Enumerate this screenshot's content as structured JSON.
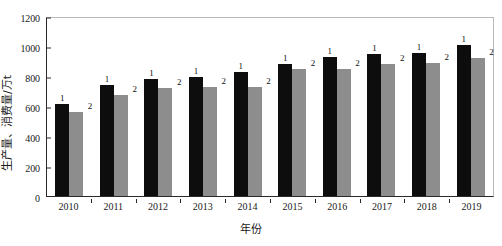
{
  "chart_data": {
    "type": "bar",
    "title": "",
    "xlabel": "年份",
    "ylabel": "生产量、消费量/万t",
    "categories": [
      "2010",
      "2011",
      "2012",
      "2013",
      "2014",
      "2015",
      "2016",
      "2017",
      "2018",
      "2019"
    ],
    "ylim": [
      0,
      1200
    ],
    "yticks": [
      0,
      200,
      400,
      600,
      800,
      1000,
      1200
    ],
    "grid": false,
    "legend_position": "none",
    "series": [
      {
        "name": "1",
        "label": "1",
        "color": "#0d0d0d",
        "values": [
          611,
          737,
          780,
          795,
          825,
          880,
          925,
          945,
          955,
          1005
        ]
      },
      {
        "name": "2",
        "label": "2",
        "color": "#8d8d8d",
        "values": [
          563,
          672,
          720,
          730,
          730,
          850,
          845,
          880,
          890,
          920
        ]
      }
    ],
    "point_labels": {
      "series_1": [
        "1",
        "1",
        "1",
        "1",
        "1",
        "1",
        "1",
        "1",
        "1",
        "1"
      ],
      "series_2": [
        "2",
        "2",
        "2",
        "2",
        "2",
        "2",
        "2",
        "2",
        "2",
        "2"
      ]
    }
  }
}
